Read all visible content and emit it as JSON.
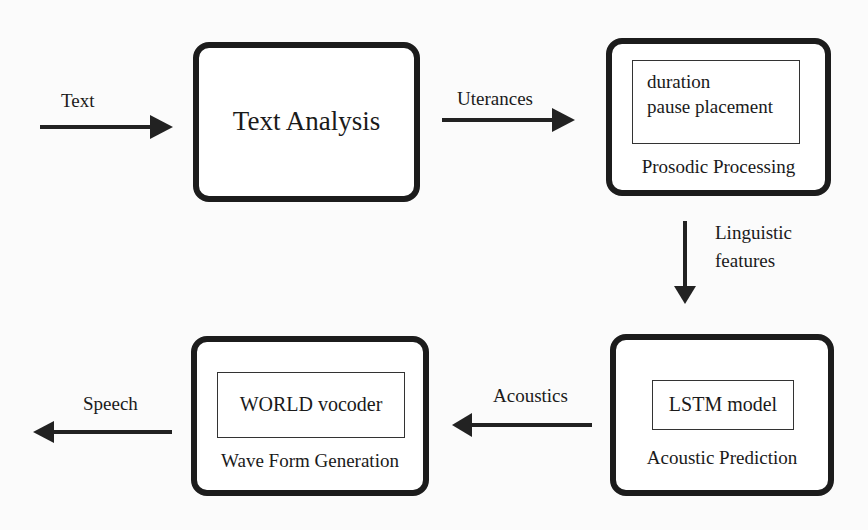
{
  "nodes": {
    "text_analysis": {
      "title": "Text Analysis"
    },
    "prosodic": {
      "inner_line1": "duration",
      "inner_line2": "pause placement",
      "title": "Prosodic Processing"
    },
    "acoustic": {
      "inner": "LSTM model",
      "title": "Acoustic Prediction"
    },
    "waveform": {
      "inner": "WORLD vocoder",
      "title": "Wave Form Generation"
    }
  },
  "edges": {
    "input": "Text",
    "utterances": "Uterances",
    "linguistic_line1": "Linguistic",
    "linguistic_line2": "features",
    "acoustics": "Acoustics",
    "speech": "Speech"
  }
}
